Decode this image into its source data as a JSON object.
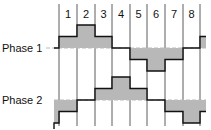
{
  "diagram": {
    "type": "two-phase stepping waveform",
    "step_labels": [
      "1",
      "2",
      "3",
      "4",
      "5",
      "6",
      "7",
      "8"
    ],
    "phases": [
      {
        "name": "Phase 1",
        "levels": [
          1,
          2,
          1,
          0,
          -1,
          -2,
          -1,
          0
        ],
        "lead_in": 0,
        "tail": 1
      },
      {
        "name": "Phase 2",
        "levels": [
          -1,
          0,
          1,
          2,
          1,
          0,
          -1,
          -2
        ],
        "lead_in": -2,
        "tail": -1
      }
    ],
    "colors": {
      "fill": "#b8b8b8",
      "line": "#111111",
      "grid": "#333333",
      "baseline_dash": "#bbbbbb"
    }
  }
}
